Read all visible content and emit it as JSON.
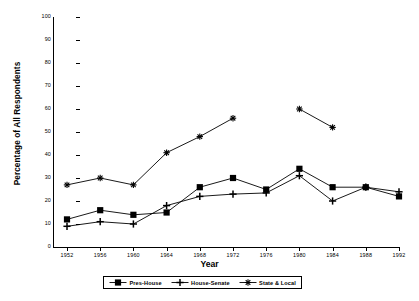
{
  "chart_data": {
    "type": "line",
    "title": "",
    "xlabel": "Year",
    "ylabel": "Percentage of All Respondents",
    "categories": [
      1952,
      1956,
      1960,
      1964,
      1968,
      1972,
      1976,
      1980,
      1984,
      1988,
      1992
    ],
    "xtick_labels": [
      "1952",
      "1956",
      "1960",
      "1964",
      "1968",
      "1972",
      "1976",
      "1980",
      "1984",
      "1988",
      "1992"
    ],
    "ytick_labels": [
      "0",
      "10",
      "20",
      "30",
      "40",
      "50",
      "60",
      "70",
      "80",
      "90",
      "100"
    ],
    "ylim": [
      0,
      100
    ],
    "xlim": [
      1952,
      1992
    ],
    "grid": false,
    "legend_position": "bottom-center",
    "series": [
      {
        "name": "Pres-House",
        "marker": "filled-square",
        "values": [
          12,
          16,
          14,
          15,
          26,
          30,
          25,
          34,
          26,
          26,
          22
        ]
      },
      {
        "name": "House-Senate",
        "marker": "plus",
        "values": [
          9,
          11,
          10,
          18,
          22,
          23,
          23.5,
          31,
          20,
          26,
          24
        ]
      },
      {
        "name": "State & Local",
        "marker": "asterisk",
        "values": [
          27,
          30,
          27,
          41,
          48,
          56,
          null,
          60,
          52,
          null,
          null
        ]
      }
    ],
    "colors": {
      "line": "#000000",
      "axis": "#000000",
      "background": "#ffffff"
    }
  },
  "legend": {
    "items": [
      {
        "label": "Pres-House",
        "icon": "filled-square-marker-icon"
      },
      {
        "label": "House-Senate",
        "icon": "plus-marker-icon"
      },
      {
        "label": "State & Local",
        "icon": "asterisk-marker-icon"
      }
    ]
  }
}
